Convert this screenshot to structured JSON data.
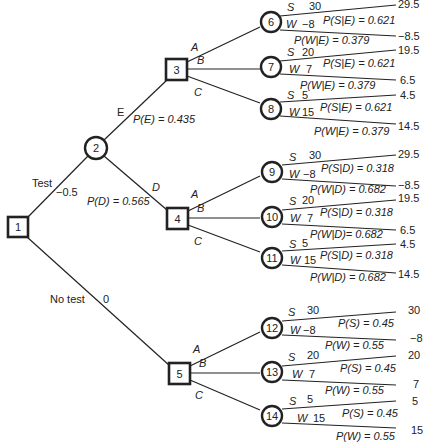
{
  "diagram": {
    "type": "decision-tree",
    "root": {
      "id": "1",
      "kind": "decision",
      "branches": [
        {
          "label": "Test",
          "cost": "−0.5",
          "to": "2"
        },
        {
          "label": "No test",
          "cost": "0",
          "to": "5"
        }
      ]
    },
    "test_chance": {
      "id": "2",
      "kind": "chance",
      "branches": [
        {
          "label": "E",
          "prob_label": "P(E) = 0.435",
          "to": "3"
        },
        {
          "label": "D",
          "prob_label": "P(D) = 0.565",
          "to": "4"
        }
      ]
    },
    "decisions": [
      {
        "id": "3",
        "options": [
          "A",
          "B",
          "C"
        ],
        "children": [
          "6",
          "7",
          "8"
        ]
      },
      {
        "id": "4",
        "options": [
          "A",
          "B",
          "C"
        ],
        "children": [
          "9",
          "10",
          "11"
        ]
      },
      {
        "id": "5",
        "options": [
          "A",
          "B",
          "C"
        ],
        "children": [
          "12",
          "13",
          "14"
        ]
      }
    ],
    "chance_nodes": [
      {
        "id": "6",
        "s_label": "S",
        "s_val": "30",
        "w_label": "W",
        "w_val": "−8",
        "ps": "P(S|E) = 0.621",
        "pw": "P(W|E) = 0.379",
        "out_s": "29.5",
        "out_w": "−8.5"
      },
      {
        "id": "7",
        "s_label": "S",
        "s_val": "20",
        "w_label": "W",
        "w_val": "7",
        "ps": "P(S|E) = 0.621",
        "pw": "P(W|E) = 0.379",
        "out_s": "19.5",
        "out_w": "6.5"
      },
      {
        "id": "8",
        "s_label": "S",
        "s_val": "5",
        "w_label": "W",
        "w_val": "15",
        "ps": "P(S|E) = 0.621",
        "pw": "P(W|E) = 0.379",
        "out_s": "4.5",
        "out_w": "14.5"
      },
      {
        "id": "9",
        "s_label": "S",
        "s_val": "30",
        "w_label": "W",
        "w_val": "−8",
        "ps": "P(S|D) = 0.318",
        "pw": "P(W|D) = 0.682",
        "out_s": "29.5",
        "out_w": "−8.5"
      },
      {
        "id": "10",
        "s_label": "S",
        "s_val": "20",
        "w_label": "W",
        "w_val": "7",
        "ps": "P(S|D) = 0.318",
        "pw": "P(W|D)= 0.682",
        "out_s": "19.5",
        "out_w": "6.5"
      },
      {
        "id": "11",
        "s_label": "S",
        "s_val": "5",
        "w_label": "W",
        "w_val": "15",
        "ps": "P(S|D) = 0.318",
        "pw": "P(W|D) = 0.682",
        "out_s": "4.5",
        "out_w": "14.5"
      },
      {
        "id": "12",
        "s_label": "S",
        "s_val": "30",
        "w_label": "W",
        "w_val": "−8",
        "ps": "P(S) = 0.45",
        "pw": "P(W) = 0.55",
        "out_s": "30",
        "out_w": "−8"
      },
      {
        "id": "13",
        "s_label": "S",
        "s_val": "20",
        "w_label": "W",
        "w_val": "7",
        "ps": "P(S) = 0.45",
        "pw": "P(W) = 0.55",
        "out_s": "20",
        "out_w": "7"
      },
      {
        "id": "14",
        "s_label": "S",
        "s_val": "5",
        "w_label": "W",
        "w_val": "15",
        "ps": "P(S) = 0.45",
        "pw": "P(W) = 0.55",
        "out_s": "5",
        "out_w": "15"
      }
    ]
  }
}
